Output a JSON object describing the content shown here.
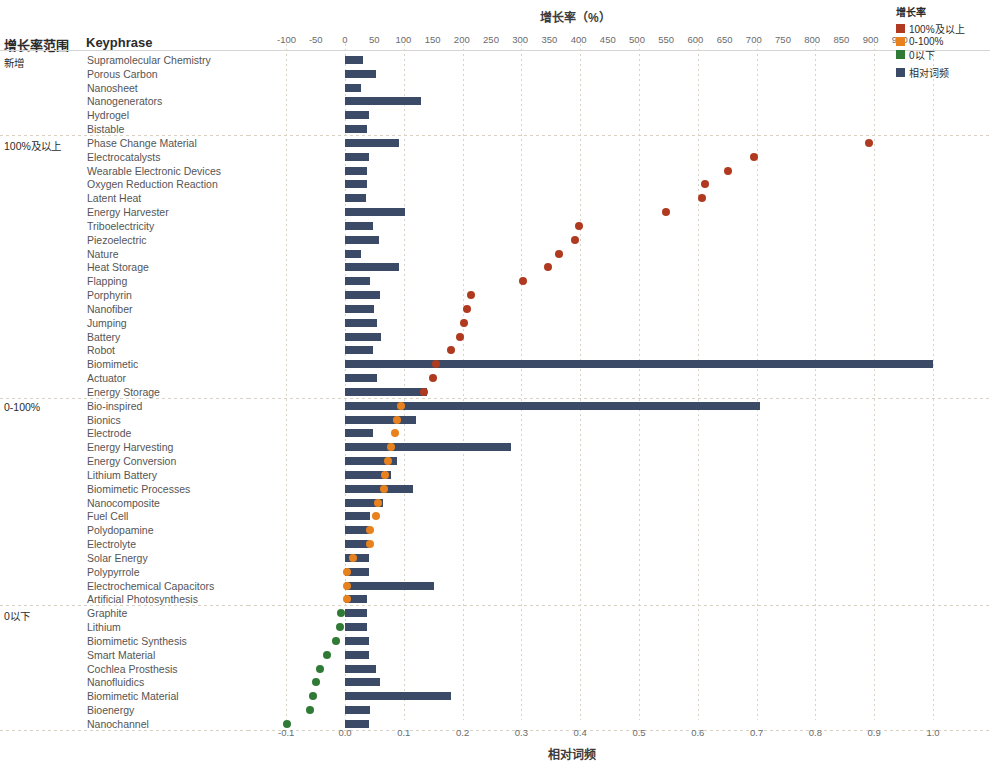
{
  "header": {
    "group_column_header": "增长率范围",
    "keyphrase_column_header": "Keyphrase"
  },
  "top_axis": {
    "title": "增长率（%）",
    "ticks": [
      "-100",
      "-50",
      "0",
      "50",
      "100",
      "150",
      "200",
      "250",
      "300",
      "350",
      "400",
      "450",
      "500",
      "550",
      "600",
      "650",
      "700",
      "750",
      "800",
      "850",
      "900",
      "950"
    ]
  },
  "bottom_axis": {
    "title": "相对词频",
    "ticks": [
      "-0.1",
      "0.0",
      "0.1",
      "0.2",
      "0.3",
      "0.4",
      "0.5",
      "0.6",
      "0.7",
      "0.8",
      "0.9",
      "1.0"
    ]
  },
  "legend": {
    "title": "增长率",
    "items": [
      {
        "label": "100%及以上",
        "color": "#b03a20",
        "shape": "square"
      },
      {
        "label": "0-100%",
        "color": "#e8821e",
        "shape": "square"
      },
      {
        "label": "0以下",
        "color": "#2f7a34",
        "shape": "square"
      },
      {
        "label": "相对词频",
        "color": "#3b4a66",
        "shape": "square"
      }
    ]
  },
  "groups": [
    {
      "label": "新增"
    },
    {
      "label": "100%及以上"
    },
    {
      "label": "0-100%"
    },
    {
      "label": "0以下"
    }
  ],
  "chart_data": {
    "type": "bar",
    "title": "增长率（%）",
    "xlabel": "相对词频",
    "xlabel_top": "增长率（%）",
    "ylabel": "Keyphrase",
    "xlim_top": [
      -100,
      950
    ],
    "xlim_bottom": [
      -0.13,
      1.05
    ],
    "grid": true,
    "legend_position": "top-right",
    "series": [
      {
        "name": "相对词频",
        "color": "#3b4a66",
        "type": "bar",
        "axis": "bottom"
      },
      {
        "name": "增长率",
        "color_100plus": "#b03a20",
        "color_0_100": "#e8821e",
        "color_below0": "#2f7a34",
        "type": "scatter",
        "axis": "top"
      }
    ],
    "rows": [
      {
        "group": "新增",
        "keyphrase": "Supramolecular Chemistry",
        "freq": 0.03,
        "growth": null,
        "growth_color": null
      },
      {
        "group": "新增",
        "keyphrase": "Porous Carbon",
        "freq": 0.053,
        "growth": null,
        "growth_color": null
      },
      {
        "group": "新增",
        "keyphrase": "Nanosheet",
        "freq": 0.028,
        "growth": null,
        "growth_color": null
      },
      {
        "group": "新增",
        "keyphrase": "Nanogenerators",
        "freq": 0.13,
        "growth": null,
        "growth_color": null
      },
      {
        "group": "新增",
        "keyphrase": "Hydrogel",
        "freq": 0.04,
        "growth": null,
        "growth_color": null
      },
      {
        "group": "新增",
        "keyphrase": "Bistable",
        "freq": 0.038,
        "growth": null,
        "growth_color": null
      },
      {
        "group": "100%及以上",
        "keyphrase": "Phase Change Material",
        "freq": 0.092,
        "growth": 898,
        "growth_color": "#b03a20"
      },
      {
        "group": "100%及以上",
        "keyphrase": "Electrocatalysts",
        "freq": 0.04,
        "growth": 700,
        "growth_color": "#b03a20"
      },
      {
        "group": "100%及以上",
        "keyphrase": "Wearable Electronic Devices",
        "freq": 0.038,
        "growth": 655,
        "growth_color": "#b03a20"
      },
      {
        "group": "100%及以上",
        "keyphrase": "Oxygen Reduction Reaction",
        "freq": 0.038,
        "growth": 617,
        "growth_color": "#b03a20"
      },
      {
        "group": "100%及以上",
        "keyphrase": "Latent Heat",
        "freq": 0.035,
        "growth": 612,
        "growth_color": "#b03a20"
      },
      {
        "group": "100%及以上",
        "keyphrase": "Energy Harvester",
        "freq": 0.102,
        "growth": 549,
        "growth_color": "#b03a20"
      },
      {
        "group": "100%及以上",
        "keyphrase": "Triboelectricity",
        "freq": 0.048,
        "growth": 400,
        "growth_color": "#b03a20"
      },
      {
        "group": "100%及以上",
        "keyphrase": "Piezoelectric",
        "freq": 0.058,
        "growth": 393,
        "growth_color": "#b03a20"
      },
      {
        "group": "100%及以上",
        "keyphrase": "Nature",
        "freq": 0.028,
        "growth": 366,
        "growth_color": "#b03a20"
      },
      {
        "group": "100%及以上",
        "keyphrase": "Heat Storage",
        "freq": 0.091,
        "growth": 348,
        "growth_color": "#b03a20"
      },
      {
        "group": "100%及以上",
        "keyphrase": "Flapping",
        "freq": 0.042,
        "growth": 305,
        "growth_color": "#b03a20"
      },
      {
        "group": "100%及以上",
        "keyphrase": "Porphyrin",
        "freq": 0.06,
        "growth": 216,
        "growth_color": "#b03a20"
      },
      {
        "group": "100%及以上",
        "keyphrase": "Nanofiber",
        "freq": 0.05,
        "growth": 209,
        "growth_color": "#b03a20"
      },
      {
        "group": "100%及以上",
        "keyphrase": "Jumping",
        "freq": 0.055,
        "growth": 203,
        "growth_color": "#b03a20"
      },
      {
        "group": "100%及以上",
        "keyphrase": "Battery",
        "freq": 0.061,
        "growth": 197,
        "growth_color": "#b03a20"
      },
      {
        "group": "100%及以上",
        "keyphrase": "Robot",
        "freq": 0.047,
        "growth": 182,
        "growth_color": "#b03a20"
      },
      {
        "group": "100%及以上",
        "keyphrase": "Biomimetic",
        "freq": 1.0,
        "growth": 155,
        "growth_color": "#b03a20"
      },
      {
        "group": "100%及以上",
        "keyphrase": "Actuator",
        "freq": 0.054,
        "growth": 150,
        "growth_color": "#b03a20"
      },
      {
        "group": "100%及以上",
        "keyphrase": "Energy Storage",
        "freq": 0.139,
        "growth": 135,
        "growth_color": "#b03a20"
      },
      {
        "group": "0-100%",
        "keyphrase": "Bio-inspired",
        "freq": 0.706,
        "growth": 96,
        "growth_color": "#e8821e"
      },
      {
        "group": "0-100%",
        "keyphrase": "Bionics",
        "freq": 0.12,
        "growth": 89,
        "growth_color": "#e8821e"
      },
      {
        "group": "0-100%",
        "keyphrase": "Electrode",
        "freq": 0.047,
        "growth": 86,
        "growth_color": "#e8821e"
      },
      {
        "group": "0-100%",
        "keyphrase": "Energy Harvesting",
        "freq": 0.282,
        "growth": 78,
        "growth_color": "#e8821e"
      },
      {
        "group": "0-100%",
        "keyphrase": "Energy Conversion",
        "freq": 0.088,
        "growth": 74,
        "growth_color": "#e8821e"
      },
      {
        "group": "0-100%",
        "keyphrase": "Lithium Battery",
        "freq": 0.078,
        "growth": 69,
        "growth_color": "#e8821e"
      },
      {
        "group": "0-100%",
        "keyphrase": "Biomimetic Processes",
        "freq": 0.115,
        "growth": 66,
        "growth_color": "#e8821e"
      },
      {
        "group": "0-100%",
        "keyphrase": "Nanocomposite",
        "freq": 0.064,
        "growth": 56,
        "growth_color": "#e8821e"
      },
      {
        "group": "0-100%",
        "keyphrase": "Fuel Cell",
        "freq": 0.043,
        "growth": 53,
        "growth_color": "#e8821e"
      },
      {
        "group": "0-100%",
        "keyphrase": "Polydopamine",
        "freq": 0.041,
        "growth": 43,
        "growth_color": "#e8821e"
      },
      {
        "group": "0-100%",
        "keyphrase": "Electrolyte",
        "freq": 0.041,
        "growth": 43,
        "growth_color": "#e8821e"
      },
      {
        "group": "0-100%",
        "keyphrase": "Solar Energy",
        "freq": 0.041,
        "growth": 13,
        "growth_color": "#e8821e"
      },
      {
        "group": "0-100%",
        "keyphrase": "Polypyrrole",
        "freq": 0.04,
        "growth": 4,
        "growth_color": "#e8821e"
      },
      {
        "group": "0-100%",
        "keyphrase": "Electrochemical Capacitors",
        "freq": 0.152,
        "growth": 4,
        "growth_color": "#e8821e"
      },
      {
        "group": "0-100%",
        "keyphrase": "Artificial Photosynthesis",
        "freq": 0.038,
        "growth": 3,
        "growth_color": "#e8821e"
      },
      {
        "group": "0以下",
        "keyphrase": "Graphite",
        "freq": 0.038,
        "growth": -6,
        "growth_color": "#2f7a34"
      },
      {
        "group": "0以下",
        "keyphrase": "Lithium",
        "freq": 0.038,
        "growth": -9,
        "growth_color": "#2f7a34"
      },
      {
        "group": "0以下",
        "keyphrase": "Biomimetic Synthesis",
        "freq": 0.04,
        "growth": -15,
        "growth_color": "#2f7a34"
      },
      {
        "group": "0以下",
        "keyphrase": "Smart Material",
        "freq": 0.041,
        "growth": -30,
        "growth_color": "#2f7a34"
      },
      {
        "group": "0以下",
        "keyphrase": "Cochlea Prosthesis",
        "freq": 0.052,
        "growth": -42,
        "growth_color": "#2f7a34"
      },
      {
        "group": "0以下",
        "keyphrase": "Nanofluidics",
        "freq": 0.06,
        "growth": -50,
        "growth_color": "#2f7a34"
      },
      {
        "group": "0以下",
        "keyphrase": "Biomimetic Material",
        "freq": 0.181,
        "growth": -55,
        "growth_color": "#2f7a34"
      },
      {
        "group": "0以下",
        "keyphrase": "Bioenergy",
        "freq": 0.043,
        "growth": -60,
        "growth_color": "#2f7a34"
      },
      {
        "group": "0以下",
        "keyphrase": "Nanochannel",
        "freq": 0.041,
        "growth": -100,
        "growth_color": "#2f7a34"
      }
    ]
  }
}
